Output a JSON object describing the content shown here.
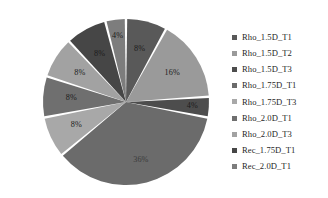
{
  "chart_data": {
    "type": "pie",
    "title": "",
    "subtitle": "",
    "xlabel": "",
    "ylabel": "",
    "legend_position": "right",
    "grid": false,
    "labels_shown": "percent",
    "start_angle_deg": -90,
    "direction": "clockwise",
    "categories": [
      "Rho_1.5D_T1",
      "Rho_1.5D_T2",
      "Rho_1.5D_T3",
      "Rho_1.75D_T1",
      "Rho_1.75D_T3",
      "Rho_2.0D_T1",
      "Rho_2.0D_T3",
      "Rec_1.75D_T1",
      "Rec_2.0D_T1"
    ],
    "values": [
      8,
      16,
      4,
      36,
      8,
      8,
      8,
      8,
      4
    ],
    "value_labels": [
      "8%",
      "16%",
      "4%",
      "36%",
      "8%",
      "8%",
      "8%",
      "8%",
      "4%"
    ],
    "colors": [
      "#595959",
      "#9a9a9a",
      "#4d4d4d",
      "#6b6b6b",
      "#a8a8a8",
      "#6f6f6f",
      "#a2a2a2",
      "#464646",
      "#7d7d7d"
    ],
    "slice_gap_color": "#ffffff",
    "total": 100
  },
  "legend": {
    "items": [
      {
        "label": "Rho_1.5D_T1",
        "color": "#595959"
      },
      {
        "label": "Rho_1.5D_T2",
        "color": "#9a9a9a"
      },
      {
        "label": "Rho_1.5D_T3",
        "color": "#4d4d4d"
      },
      {
        "label": "Rho_1.75D_T1",
        "color": "#6b6b6b"
      },
      {
        "label": "Rho_1.75D_T3",
        "color": "#a8a8a8"
      },
      {
        "label": "Rho_2.0D_T1",
        "color": "#6f6f6f"
      },
      {
        "label": "Rho_2.0D_T3",
        "color": "#a2a2a2"
      },
      {
        "label": "Rec_1.75D_T1",
        "color": "#464646"
      },
      {
        "label": "Rec_2.0D_T1",
        "color": "#7d7d7d"
      }
    ]
  }
}
